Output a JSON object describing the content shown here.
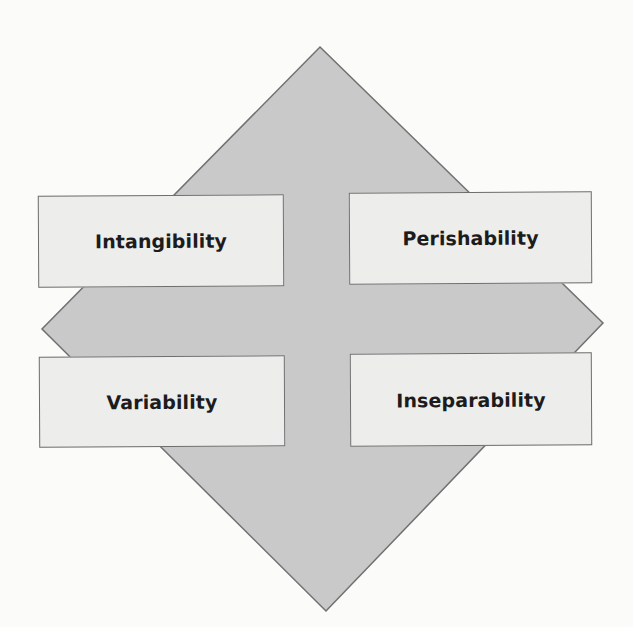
{
  "diagram": {
    "title": "",
    "shape": "diamond",
    "colors": {
      "background": "#fbfbfa",
      "diamond_fill": "#c9c9c9",
      "diamond_stroke": "#707070",
      "box_fill": "#ededec",
      "box_stroke": "#6e6e6e",
      "text": "#1c1c1c"
    },
    "diamond_points": {
      "top": [
        320,
        47
      ],
      "right": [
        603,
        323
      ],
      "bottom": [
        326,
        611
      ],
      "left": [
        42,
        329
      ]
    },
    "boxes": [
      {
        "position": "top-left",
        "label": "Intangibility"
      },
      {
        "position": "top-right",
        "label": "Perishability"
      },
      {
        "position": "bottom-left",
        "label": "Variability"
      },
      {
        "position": "bottom-right",
        "label": "Inseparability"
      }
    ]
  }
}
